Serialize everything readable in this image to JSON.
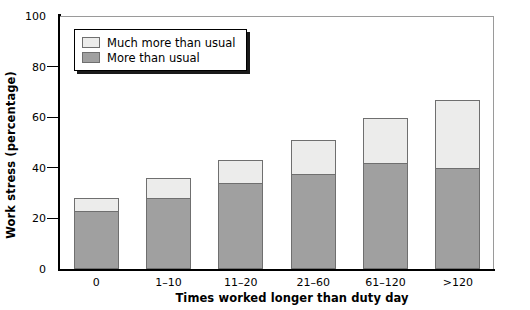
{
  "chart_data": {
    "type": "bar",
    "subtype": "stacked-bar",
    "title": "",
    "xlabel": "Times worked longer than duty day",
    "ylabel": "Work stress (percentage)",
    "categories": [
      "0",
      "1–10",
      "11–20",
      "21–60",
      "61–120",
      ">120"
    ],
    "series": [
      {
        "name": "More than usual",
        "color": "#a0a0a0",
        "values": [
          23,
          28,
          34,
          37.5,
          42,
          40
        ]
      },
      {
        "name": "Much more than usual",
        "color": "#ececeb",
        "values": [
          5,
          8,
          9,
          13.5,
          17.5,
          27
        ]
      }
    ],
    "totals": [
      28,
      36,
      43,
      51,
      59.5,
      67
    ],
    "ylim": [
      0,
      100
    ],
    "yticks": [
      0,
      20,
      40,
      60,
      80,
      100
    ],
    "ytick_labels": [
      "0",
      "20",
      "40",
      "60",
      "80",
      "100"
    ],
    "grid": false,
    "legend_position": "top-left-inside",
    "stack_order_top_to_bottom": [
      "Much more than usual",
      "More than usual"
    ]
  },
  "legend": {
    "items": [
      {
        "label": "Much more than usual",
        "swatch": "much"
      },
      {
        "label": "More than usual",
        "swatch": "more"
      }
    ]
  },
  "axes": {
    "y_title": "Work stress (percentage)",
    "x_title": "Times worked longer than duty day"
  }
}
